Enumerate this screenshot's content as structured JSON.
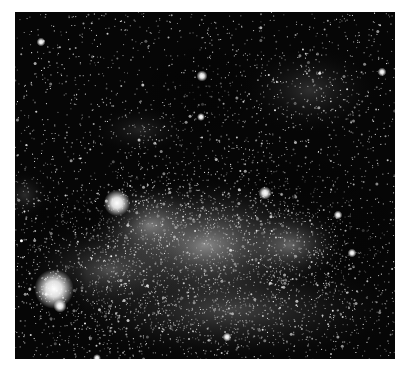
{
  "image": {
    "subject": "Milky Way star field",
    "description": "Grayscale astronomical photograph of a dense Milky Way star field with bright star clouds and dark dust lanes",
    "background_color": "#ffffff",
    "frame": {
      "x": 15,
      "y": 12,
      "width": 380,
      "height": 347,
      "base_color": "#060606"
    }
  },
  "nebula_glows": [
    {
      "x": 205,
      "y": 245,
      "rx": 130,
      "ry": 70,
      "intensity": 0.62
    },
    {
      "x": 150,
      "y": 225,
      "rx": 60,
      "ry": 45,
      "intensity": 0.5
    },
    {
      "x": 290,
      "y": 245,
      "rx": 60,
      "ry": 40,
      "intensity": 0.42
    },
    {
      "x": 110,
      "y": 270,
      "rx": 90,
      "ry": 50,
      "intensity": 0.35
    },
    {
      "x": 230,
      "y": 310,
      "rx": 180,
      "ry": 55,
      "intensity": 0.3
    },
    {
      "x": 310,
      "y": 90,
      "rx": 70,
      "ry": 45,
      "intensity": 0.2
    },
    {
      "x": 140,
      "y": 130,
      "rx": 50,
      "ry": 25,
      "intensity": 0.14
    },
    {
      "x": 25,
      "y": 195,
      "rx": 25,
      "ry": 25,
      "intensity": 0.18
    }
  ],
  "dust_lanes": [
    {
      "x": 200,
      "y": 90,
      "rx": 60,
      "ry": 50,
      "opacity": 0.55
    },
    {
      "x": 90,
      "y": 215,
      "rx": 70,
      "ry": 18,
      "opacity": 0.5
    },
    {
      "x": 300,
      "y": 180,
      "rx": 80,
      "ry": 25,
      "opacity": 0.45
    },
    {
      "x": 360,
      "y": 230,
      "rx": 40,
      "ry": 60,
      "opacity": 0.35
    },
    {
      "x": 75,
      "y": 290,
      "rx": 12,
      "ry": 40,
      "opacity": 0.4
    }
  ],
  "bright_stars": [
    {
      "x": 54,
      "y": 289,
      "r": 9,
      "label": "bright-star"
    },
    {
      "x": 117,
      "y": 203,
      "r": 6,
      "label": "star-cluster"
    },
    {
      "x": 60,
      "y": 306,
      "r": 3
    },
    {
      "x": 202,
      "y": 76,
      "r": 2.5
    },
    {
      "x": 265,
      "y": 193,
      "r": 3
    },
    {
      "x": 382,
      "y": 72,
      "r": 2
    },
    {
      "x": 41,
      "y": 42,
      "r": 2
    },
    {
      "x": 227,
      "y": 337,
      "r": 2
    },
    {
      "x": 338,
      "y": 215,
      "r": 2
    },
    {
      "x": 352,
      "y": 253,
      "r": 2
    },
    {
      "x": 201,
      "y": 117,
      "r": 1.8
    },
    {
      "x": 97,
      "y": 358,
      "r": 1.8
    }
  ],
  "star_field": {
    "count": 5200,
    "seed": 7,
    "band_count": 3600
  }
}
